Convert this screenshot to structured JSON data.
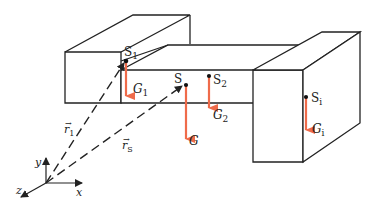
{
  "diagram": {
    "colors": {
      "line": "#222222",
      "force": "#ef6b4a",
      "background": "#ffffff"
    },
    "points": {
      "s1": {
        "label": "S",
        "sub": "1"
      },
      "s": {
        "label": "S",
        "sub": ""
      },
      "s2": {
        "label": "S",
        "sub": "2"
      },
      "si": {
        "label": "S",
        "sub": "i"
      }
    },
    "forces": {
      "g1": {
        "label": "G",
        "sub": "1"
      },
      "g": {
        "label": "G",
        "sub": ""
      },
      "g2": {
        "label": "G",
        "sub": "2"
      },
      "gi": {
        "label": "G",
        "sub": "i"
      }
    },
    "vectors": {
      "r1": {
        "label": "r",
        "sub": "1",
        "arrow": "→"
      },
      "rs": {
        "label": "r",
        "sub": "S",
        "arrow": "→"
      }
    },
    "axes": {
      "x": "x",
      "y": "y",
      "z": "z"
    }
  }
}
